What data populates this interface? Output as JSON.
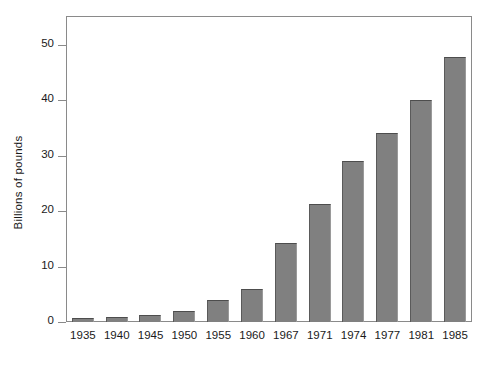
{
  "chart_data": {
    "type": "bar",
    "title": "",
    "subtitle": "",
    "xlabel": "",
    "ylabel": "Billions of pounds",
    "categories": [
      "1935",
      "1940",
      "1945",
      "1950",
      "1955",
      "1960",
      "1967",
      "1971",
      "1974",
      "1977",
      "1981",
      "1985"
    ],
    "values": [
      0.7,
      0.8,
      1.2,
      2.0,
      4.0,
      6.0,
      14.2,
      21.2,
      29.0,
      34.0,
      40.0,
      47.8
    ],
    "ytick_labels": [
      "0",
      "10",
      "20",
      "30",
      "40",
      "50"
    ],
    "ytick_values": [
      0,
      10,
      20,
      30,
      40,
      50
    ],
    "ylim": [
      0,
      55
    ],
    "grid": false,
    "legend": null,
    "legend_position": "none",
    "bar_color": "#808080",
    "bar_edge_color": "#4d4d4d",
    "axis_color": "#8a8a8a",
    "background": "#ffffff",
    "annotations": []
  }
}
